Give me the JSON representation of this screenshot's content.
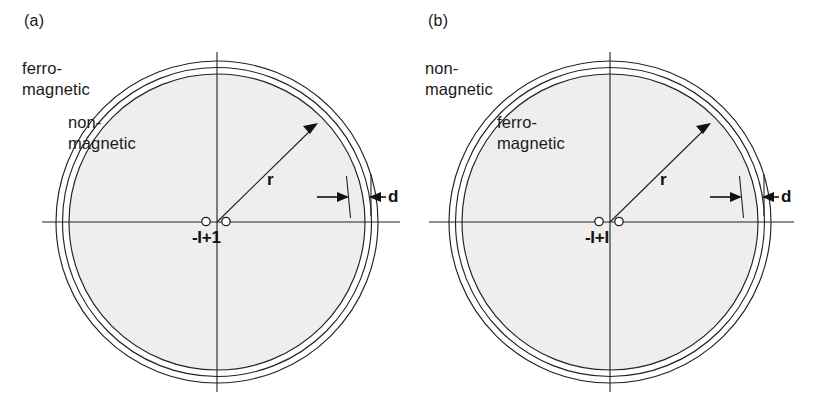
{
  "figure": {
    "background_color": "#ffffff",
    "stroke_color": "#222222",
    "disk_fill_color": "#eeeeee"
  },
  "panels": [
    {
      "id": "a",
      "label": "(a)",
      "outer_region_label": "ferro-\nmagnetic",
      "inner_region_label": "non-\nmagnetic",
      "radius_label": "r",
      "thickness_label": "d",
      "origin_label": "-I+1",
      "origin_marker_count": 2,
      "ring_count": 3
    },
    {
      "id": "b",
      "label": "(b)",
      "outer_region_label": "non-\nmagnetic",
      "inner_region_label": "ferro-\nmagnetic",
      "radius_label": "r",
      "thickness_label": "d",
      "origin_label": "-I+I",
      "origin_marker_count": 2,
      "ring_count": 3
    }
  ]
}
